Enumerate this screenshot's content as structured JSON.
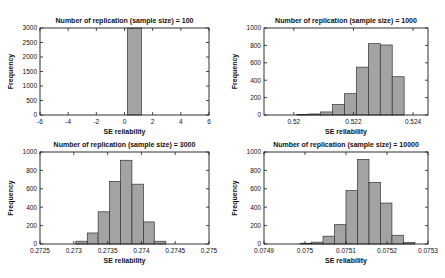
{
  "figure": {
    "background": "#ffffff",
    "bar_fill": "#a3a3a3",
    "bar_edge": "#333333",
    "axis_color": "#1c1c1c",
    "text_color": "#111111"
  },
  "chart_data": [
    {
      "type": "bar",
      "id": "n100",
      "title": "Number of replication (sample size) = 100",
      "xlabel": "SE reliability",
      "ylabel": "Frequency",
      "xlim": [
        -6,
        6
      ],
      "ylim": [
        0,
        3000
      ],
      "xticks": [
        -6,
        -4,
        -2,
        0,
        2,
        4,
        6
      ],
      "xtick_labels": [
        "-6",
        "-4",
        "-2",
        "0",
        "2",
        "4",
        "6"
      ],
      "yticks": [
        0,
        500,
        1000,
        1500,
        2000,
        2500,
        3000
      ],
      "ytick_labels": [
        "0",
        "500",
        "1000",
        "1500",
        "2000",
        "2500",
        "3000"
      ],
      "grid": false,
      "legend": null,
      "bins": [
        [
          0.2,
          1.2,
          3000
        ]
      ]
    },
    {
      "type": "bar",
      "id": "n1000",
      "title": "Number of replication (sample size) = 1000",
      "xlabel": "SE reliability",
      "ylabel": "Frequency",
      "xlim": [
        0.519,
        0.5245
      ],
      "ylim": [
        0,
        1000
      ],
      "xticks": [
        0.52,
        0.522,
        0.524
      ],
      "xtick_labels": [
        "0.52",
        "0.522",
        "0.524"
      ],
      "yticks": [
        0,
        200,
        400,
        600,
        800,
        1000
      ],
      "ytick_labels": [
        "0",
        "200",
        "400",
        "600",
        "800",
        "1000"
      ],
      "grid": false,
      "legend": null,
      "bins": [
        [
          0.5201,
          0.5205,
          5
        ],
        [
          0.5205,
          0.5209,
          12
        ],
        [
          0.5209,
          0.5213,
          35
        ],
        [
          0.5213,
          0.5217,
          120
        ],
        [
          0.5217,
          0.5221,
          245
        ],
        [
          0.5221,
          0.5225,
          550
        ],
        [
          0.5225,
          0.5229,
          820
        ],
        [
          0.5229,
          0.5233,
          805
        ],
        [
          0.5233,
          0.5237,
          440
        ]
      ]
    },
    {
      "type": "bar",
      "id": "n3000",
      "title": "Number of replication (sample size) = 3000",
      "xlabel": "SE reliability",
      "ylabel": "Frequency",
      "xlim": [
        0.2725,
        0.275
      ],
      "ylim": [
        0,
        1000
      ],
      "xticks": [
        0.2725,
        0.273,
        0.2735,
        0.274,
        0.2745,
        0.275
      ],
      "xtick_labels": [
        "0.2725",
        "0.273",
        "0.2735",
        "0.274",
        "0.2745",
        "0.275"
      ],
      "yticks": [
        0,
        200,
        400,
        600,
        800,
        1000
      ],
      "ytick_labels": [
        "0",
        "200",
        "400",
        "600",
        "800",
        "1000"
      ],
      "grid": false,
      "legend": null,
      "bins": [
        [
          0.27303,
          0.2732,
          30
        ],
        [
          0.2732,
          0.27336,
          120
        ],
        [
          0.27336,
          0.27353,
          350
        ],
        [
          0.27353,
          0.27369,
          680
        ],
        [
          0.27369,
          0.27386,
          910
        ],
        [
          0.27386,
          0.27403,
          650
        ],
        [
          0.27403,
          0.27419,
          240
        ],
        [
          0.27419,
          0.27436,
          30
        ]
      ]
    },
    {
      "type": "bar",
      "id": "n10000",
      "title": "Number of replication (sample size) = 10000",
      "xlabel": "SE reliability",
      "ylabel": "Frequency",
      "xlim": [
        0.0749,
        0.0753
      ],
      "ylim": [
        0,
        1000
      ],
      "xticks": [
        0.0749,
        0.075,
        0.0751,
        0.0752,
        0.0753
      ],
      "xtick_labels": [
        "0.0749",
        "0.075",
        "0.0751",
        "0.0752",
        "0.0753"
      ],
      "yticks": [
        0,
        200,
        400,
        600,
        800,
        1000
      ],
      "ytick_labels": [
        "0",
        "200",
        "400",
        "600",
        "800",
        "1000"
      ],
      "grid": false,
      "legend": null,
      "bins": [
        [
          0.074988,
          0.075016,
          8
        ],
        [
          0.075016,
          0.075044,
          20
        ],
        [
          0.075044,
          0.075072,
          85
        ],
        [
          0.075072,
          0.0751,
          210
        ],
        [
          0.0751,
          0.075128,
          580
        ],
        [
          0.075128,
          0.075156,
          920
        ],
        [
          0.075156,
          0.075184,
          670
        ],
        [
          0.075184,
          0.075212,
          445
        ],
        [
          0.075212,
          0.07524,
          95
        ],
        [
          0.07524,
          0.075268,
          15
        ]
      ]
    }
  ]
}
